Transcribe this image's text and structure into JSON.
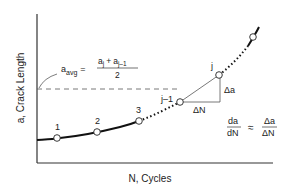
{
  "diagram": {
    "type": "crack-growth-curve",
    "x_axis_label": "N, Cycles",
    "y_axis_label": "a, Crack Length",
    "point_labels": [
      "1",
      "2",
      "3",
      "j–1",
      "j"
    ],
    "avg_formula": {
      "lhs_base": "a",
      "lhs_sub": "avg",
      "equals": "=",
      "num_a": "a",
      "num_a_sub": "j",
      "plus": "+",
      "num_b": "a",
      "num_b_sub": "j–1",
      "den": "2"
    },
    "delta_a": "Δa",
    "delta_N": "ΔN",
    "rate_formula": {
      "lhs_num": "da",
      "lhs_den": "dN",
      "approx": "≈",
      "rhs_num": "Δa",
      "rhs_den": "ΔN"
    }
  }
}
